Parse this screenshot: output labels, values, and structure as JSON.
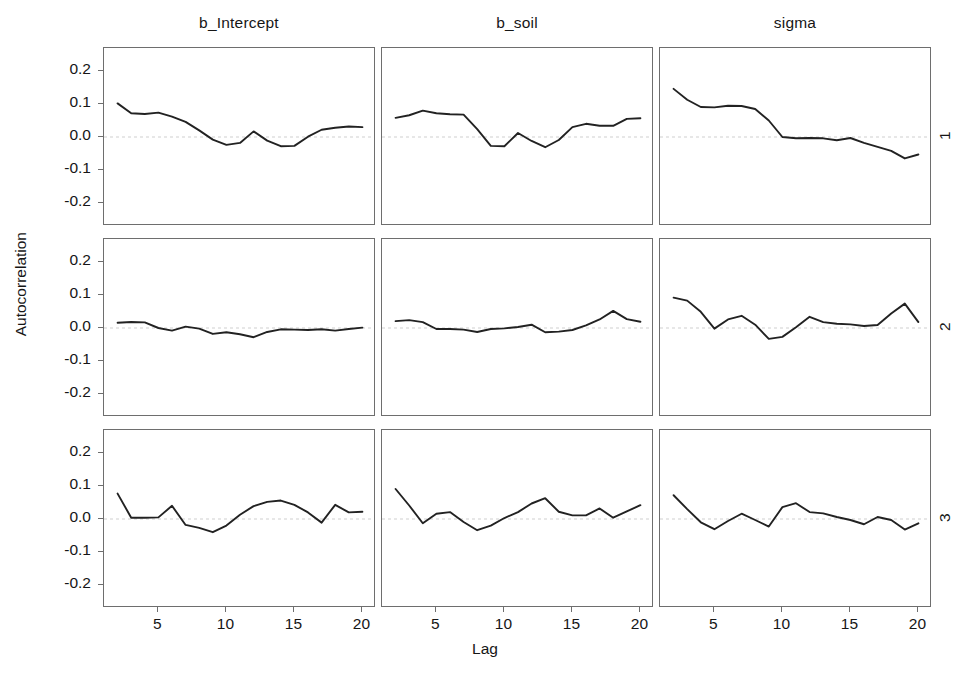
{
  "figure": {
    "xlabel": "Lag",
    "ylabel": "Autocorrelation"
  },
  "chart_data": {
    "type": "line",
    "title": "",
    "xlabel": "Lag",
    "ylabel": "Autocorrelation",
    "xlim": [
      1,
      21
    ],
    "ylim": [
      -0.27,
      0.27
    ],
    "xticks": [
      5,
      10,
      15,
      20
    ],
    "yticks": [
      0.2,
      0.1,
      0.0,
      -0.1,
      -0.2
    ],
    "ytick_labels": [
      "0.2",
      "0.1",
      "0.0",
      "-0.1",
      "-0.2"
    ],
    "xtick_labels": [
      "5",
      "10",
      "15",
      "20"
    ],
    "grid": false,
    "zero_line": true,
    "legend": "none",
    "facet_cols": [
      "b_Intercept",
      "b_soil",
      "sigma"
    ],
    "facet_rows": [
      "1",
      "2",
      "3"
    ],
    "x": [
      2,
      3,
      4,
      5,
      6,
      7,
      8,
      9,
      10,
      11,
      12,
      13,
      14,
      15,
      16,
      17,
      18,
      19,
      20
    ],
    "panels": [
      {
        "column": "b_Intercept",
        "row": "1",
        "values": [
          0.102,
          0.072,
          0.07,
          0.074,
          0.062,
          0.046,
          0.02,
          -0.008,
          -0.024,
          -0.018,
          0.017,
          -0.011,
          -0.028,
          -0.027,
          0.001,
          0.022,
          0.028,
          0.032,
          0.03
        ]
      },
      {
        "column": "b_soil",
        "row": "1",
        "values": [
          0.058,
          0.066,
          0.08,
          0.072,
          0.069,
          0.068,
          0.024,
          -0.027,
          -0.028,
          0.012,
          -0.012,
          -0.031,
          -0.009,
          0.03,
          0.04,
          0.034,
          0.034,
          0.055,
          0.057
        ]
      },
      {
        "column": "sigma",
        "row": "1",
        "values": [
          0.146,
          0.113,
          0.091,
          0.09,
          0.095,
          0.094,
          0.085,
          0.05,
          0.0,
          -0.004,
          -0.003,
          -0.004,
          -0.01,
          -0.003,
          -0.018,
          -0.03,
          -0.042,
          -0.065,
          -0.053
        ]
      },
      {
        "column": "b_Intercept",
        "row": "2",
        "values": [
          0.016,
          0.018,
          0.017,
          0.0,
          -0.008,
          0.004,
          -0.002,
          -0.018,
          -0.013,
          -0.019,
          -0.028,
          -0.012,
          -0.004,
          -0.005,
          -0.006,
          -0.004,
          -0.008,
          -0.003,
          0.001
        ]
      },
      {
        "column": "b_soil",
        "row": "2",
        "values": [
          0.021,
          0.024,
          0.018,
          -0.003,
          -0.003,
          -0.005,
          -0.012,
          -0.003,
          -0.001,
          0.003,
          0.01,
          -0.013,
          -0.011,
          -0.006,
          0.008,
          0.026,
          0.052,
          0.027,
          0.019
        ]
      },
      {
        "column": "sigma",
        "row": "2",
        "values": [
          0.092,
          0.083,
          0.049,
          -0.002,
          0.026,
          0.037,
          0.01,
          -0.033,
          -0.027,
          0.002,
          0.034,
          0.018,
          0.013,
          0.011,
          0.006,
          0.009,
          0.044,
          0.074,
          0.018
        ]
      },
      {
        "column": "b_Intercept",
        "row": "3",
        "values": [
          0.077,
          0.004,
          0.004,
          0.005,
          0.04,
          -0.018,
          -0.027,
          -0.04,
          -0.02,
          0.013,
          0.039,
          0.052,
          0.056,
          0.043,
          0.02,
          -0.011,
          0.043,
          0.02,
          0.022
        ]
      },
      {
        "column": "b_soil",
        "row": "3",
        "values": [
          0.091,
          0.041,
          -0.013,
          0.016,
          0.021,
          -0.009,
          -0.034,
          -0.02,
          0.003,
          0.021,
          0.047,
          0.063,
          0.022,
          0.011,
          0.011,
          0.032,
          0.004,
          0.023,
          0.042
        ]
      },
      {
        "column": "sigma",
        "row": "3",
        "values": [
          0.072,
          0.03,
          -0.01,
          -0.031,
          -0.006,
          0.016,
          -0.003,
          -0.023,
          0.036,
          0.048,
          0.021,
          0.017,
          0.006,
          -0.003,
          -0.016,
          0.006,
          -0.003,
          -0.032,
          -0.013
        ]
      }
    ]
  }
}
